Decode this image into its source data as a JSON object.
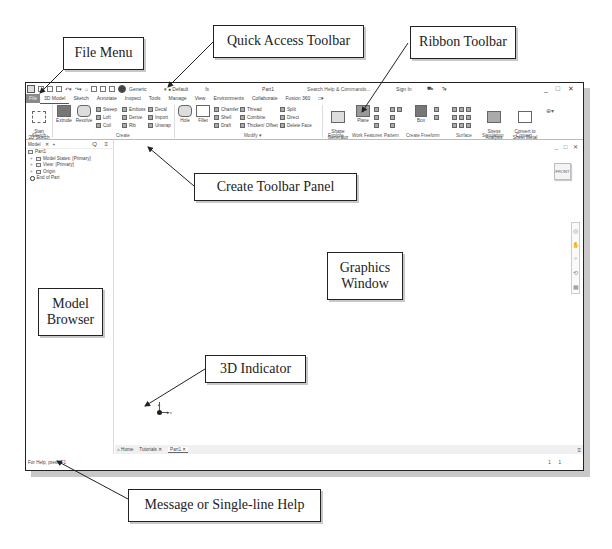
{
  "window": {
    "title": "Part1",
    "search_placeholder": "Search Help & Commands...",
    "sign_in": "Sign In",
    "controls": "_ □ ✕",
    "qat": {
      "appearance": "Generic",
      "material": "Default",
      "fx": "fx"
    }
  },
  "tabs": [
    "File",
    "3D Model",
    "Sketch",
    "Annotate",
    "Inspect",
    "Tools",
    "Manage",
    "View",
    "Environments",
    "Collaborate",
    "Fusion 360",
    "□▾"
  ],
  "ribbon": {
    "sketch": {
      "start_label": "Start\n2D Sketch",
      "panel": "Sketch"
    },
    "create": {
      "panel": "Create",
      "big": [
        "Extrude",
        "Revolve"
      ],
      "small": [
        "Sweep",
        "Loft",
        "Coil",
        "Emboss",
        "Derive",
        "Rib",
        "Decal",
        "Import",
        "Unwrap"
      ]
    },
    "modify": {
      "panel": "Modify ▾",
      "big": [
        "Hole",
        "Fillet"
      ],
      "small": [
        "Chamfer",
        "Shell",
        "Draft",
        "Thread",
        "Combine",
        "Thicken/ Offset",
        "Split",
        "Direct",
        "Delete Face"
      ]
    },
    "explore": {
      "panel": "Explore",
      "label": "Shape\nGenerator"
    },
    "work_features": {
      "panel": "Work Features",
      "label": "Plane"
    },
    "pattern": {
      "panel": "Pattern"
    },
    "freeform": {
      "panel": "Create Freeform",
      "label": "Box"
    },
    "surface": {
      "panel": "Surface"
    },
    "simulation": {
      "panel": "Simulation",
      "label": "Stress\nAnalysis"
    },
    "convert": {
      "panel": "Convert",
      "label": "Convert to\nSheet Metal"
    }
  },
  "browser": {
    "tab": "Model",
    "close": "✕",
    "add": "+",
    "tools": "Q ≡",
    "items": [
      {
        "label": "Part1",
        "level": 0
      },
      {
        "label": "Model States: [Primary]",
        "level": 1
      },
      {
        "label": "View: [Primary]",
        "level": 1
      },
      {
        "label": "Origin",
        "level": 1
      },
      {
        "label": "End of Part",
        "level": 1
      }
    ]
  },
  "graphics": {
    "viewcube_label": "FRONT",
    "window_controls": "_ □ ✕",
    "triad_x": "x"
  },
  "doc_tabs": {
    "home": "Home",
    "tutorials": "Tutorials ✕",
    "part": "Part1 ✕",
    "menu": "≡"
  },
  "status": {
    "help": "For Help, press F1",
    "count1": "1",
    "count2": "1"
  },
  "callouts": {
    "file_menu": "File Menu",
    "quick_access": "Quick Access Toolbar",
    "ribbon": "Ribbon Toolbar",
    "create_panel": "Create Toolbar Panel",
    "graphics": "Graphics Window",
    "model_browser": "Model Browser",
    "indicator_3d": "3D Indicator",
    "message": "Message or Single-line Help"
  }
}
